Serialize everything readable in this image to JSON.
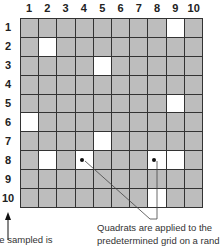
{
  "diagram": {
    "columns": [
      "1",
      "2",
      "3",
      "4",
      "5",
      "6",
      "7",
      "8",
      "9",
      "10"
    ],
    "rows": [
      "1",
      "2",
      "3",
      "4",
      "5",
      "6",
      "7",
      "8",
      "9",
      "10"
    ],
    "colors": {
      "cell": "#bdbdbd",
      "sampled": "#ffffff",
      "grid_line": "#333333"
    },
    "sampled_cells": [
      {
        "row": 1,
        "col": 9
      },
      {
        "row": 2,
        "col": 2
      },
      {
        "row": 3,
        "col": 5
      },
      {
        "row": 5,
        "col": 9
      },
      {
        "row": 6,
        "col": 1
      },
      {
        "row": 7,
        "col": 5
      },
      {
        "row": 8,
        "col": 2
      },
      {
        "row": 8,
        "col": 4
      },
      {
        "row": 8,
        "col": 8
      },
      {
        "row": 8,
        "col": 9
      },
      {
        "row": 10,
        "col": 8
      }
    ],
    "marked_cells": [
      {
        "row": 8,
        "col": 4
      },
      {
        "row": 8,
        "col": 8
      }
    ]
  },
  "captions": {
    "left": "he sampled is",
    "right_line1": "Quadrats are applied to the",
    "right_line2": "predetermined grid on a rand"
  }
}
